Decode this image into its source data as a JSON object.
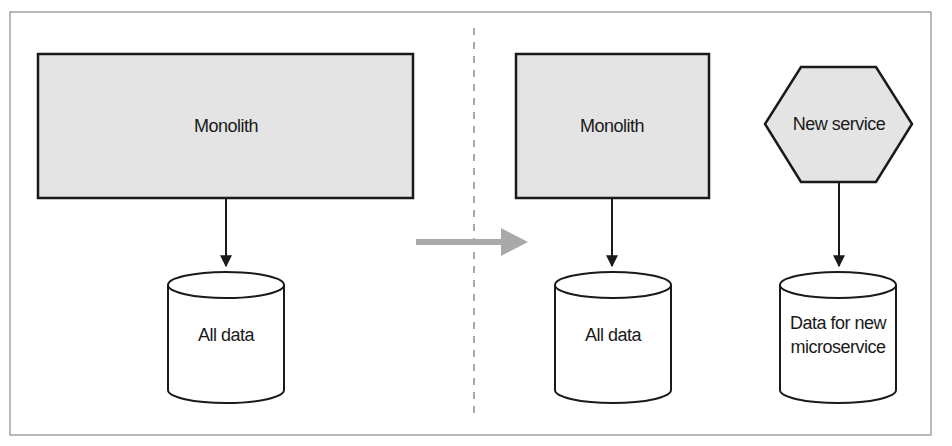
{
  "diagram": {
    "type": "architecture-migration",
    "colors": {
      "frame_border": "#8a8a8a",
      "box_fill": "#e4e4e4",
      "stroke": "#1a1a1a",
      "transition_arrow": "#a9a9a9",
      "divider": "#a9a9a9"
    },
    "before": {
      "monolith": {
        "label": "Monolith"
      },
      "database": {
        "label": "All data"
      }
    },
    "transition": {
      "arrow": "right-arrow"
    },
    "after": {
      "monolith": {
        "label": "Monolith"
      },
      "monolith_database": {
        "label": "All data"
      },
      "new_service": {
        "label": "New service",
        "shape": "hexagon"
      },
      "new_service_database": {
        "label_line1": "Data for new",
        "label_line2": "microservice"
      }
    }
  }
}
